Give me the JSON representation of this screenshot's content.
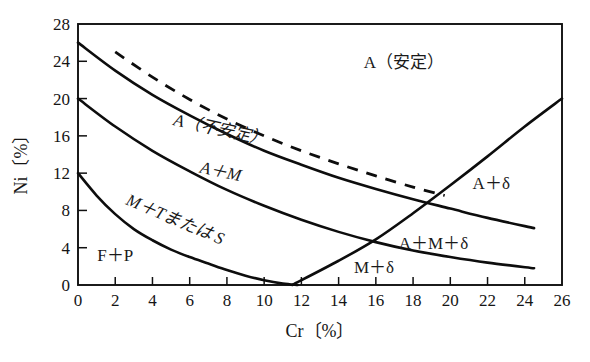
{
  "chart_data": {
    "type": "line",
    "title": "",
    "xlabel": "Cr〔%〕",
    "ylabel": "Ni〔%〕",
    "xlim": [
      0,
      26
    ],
    "ylim": [
      0,
      28
    ],
    "xticks": [
      "0",
      "2",
      "4",
      "6",
      "8",
      "10",
      "12",
      "14",
      "16",
      "18",
      "20",
      "22",
      "24",
      "26"
    ],
    "yticks": [
      "0",
      "4",
      "8",
      "12",
      "16",
      "20",
      "24",
      "28"
    ],
    "grid": false,
    "legend": "none",
    "series": [
      {
        "name": "austenite-stable-boundary",
        "style": "solid",
        "points": [
          [
            0,
            26.0
          ],
          [
            2,
            23.0
          ],
          [
            4,
            20.4
          ],
          [
            6,
            18.2
          ],
          [
            8,
            16.2
          ],
          [
            10,
            14.4
          ],
          [
            12,
            12.9
          ],
          [
            14,
            11.5
          ],
          [
            16,
            10.3
          ],
          [
            18,
            9.2
          ],
          [
            20,
            8.2
          ],
          [
            22,
            7.2
          ],
          [
            24.5,
            6.1
          ]
        ]
      },
      {
        "name": "austenite-unstable-boundary",
        "style": "dashed",
        "points": [
          [
            2,
            25.0
          ],
          [
            4,
            22.3
          ],
          [
            6,
            19.9
          ],
          [
            8,
            17.8
          ],
          [
            10,
            16.0
          ],
          [
            12,
            14.4
          ],
          [
            14,
            13.0
          ],
          [
            16,
            11.7
          ],
          [
            18,
            10.5
          ],
          [
            19.7,
            9.6
          ]
        ]
      },
      {
        "name": "a-plus-m-boundary",
        "style": "solid",
        "points": [
          [
            0,
            20.0
          ],
          [
            2,
            17.0
          ],
          [
            4,
            14.4
          ],
          [
            6,
            12.2
          ],
          [
            8,
            10.2
          ],
          [
            10,
            8.5
          ],
          [
            12,
            7.0
          ],
          [
            14,
            5.7
          ],
          [
            16,
            4.6
          ],
          [
            18,
            3.7
          ],
          [
            20,
            3.0
          ],
          [
            22,
            2.4
          ],
          [
            24.5,
            1.8
          ]
        ]
      },
      {
        "name": "f-plus-p-boundary",
        "style": "solid",
        "points": [
          [
            0,
            12.0
          ],
          [
            1,
            9.6
          ],
          [
            2,
            7.6
          ],
          [
            3,
            6.0
          ],
          [
            4,
            4.8
          ],
          [
            5,
            3.8
          ],
          [
            6,
            3.0
          ],
          [
            7,
            2.3
          ],
          [
            8,
            1.6
          ],
          [
            9,
            1.0
          ],
          [
            10,
            0.5
          ],
          [
            11,
            0.15
          ],
          [
            11.8,
            0.0
          ]
        ]
      },
      {
        "name": "delta-ferrite-boundary",
        "style": "solid",
        "points": [
          [
            11.5,
            0.0
          ],
          [
            14,
            2.6
          ],
          [
            16,
            4.9
          ],
          [
            18,
            7.7
          ],
          [
            20,
            10.7
          ],
          [
            22,
            13.8
          ],
          [
            24,
            17.0
          ],
          [
            26,
            20.0
          ]
        ]
      }
    ],
    "region_labels": [
      {
        "name": "a-stable",
        "text": "A（安定）",
        "x": 17.5,
        "y": 23.3,
        "italic": false,
        "rotation": 0
      },
      {
        "name": "a-unstable",
        "text": "A（不安定）",
        "x": 7.6,
        "y": 16.1,
        "italic": true,
        "rotation": 12
      },
      {
        "name": "a-plus-m",
        "text": "A＋M",
        "x": 7.6,
        "y": 11.6,
        "italic": true,
        "rotation": 12
      },
      {
        "name": "m-plus-t-or-s",
        "text": "M＋Tまたは S",
        "x": 5.1,
        "y": 6.5,
        "italic": true,
        "rotation": 23
      },
      {
        "name": "f-plus-p",
        "text": "F＋P",
        "x": 2.0,
        "y": 2.6,
        "italic": false,
        "rotation": 0
      },
      {
        "name": "a-plus-delta",
        "text": "A＋δ",
        "x": 22.2,
        "y": 10.3,
        "italic": false,
        "rotation": 0
      },
      {
        "name": "a-plus-m-plus-delta",
        "text": "A＋M＋δ",
        "x": 19.1,
        "y": 3.9,
        "italic": false,
        "rotation": 0
      },
      {
        "name": "m-plus-delta",
        "text": "M＋δ",
        "x": 15.9,
        "y": 1.3,
        "italic": false,
        "rotation": 0
      }
    ],
    "colors": {
      "background": "#ffffff",
      "line": "#0d0d0d",
      "axis": "#101010",
      "text": "#151515"
    }
  }
}
